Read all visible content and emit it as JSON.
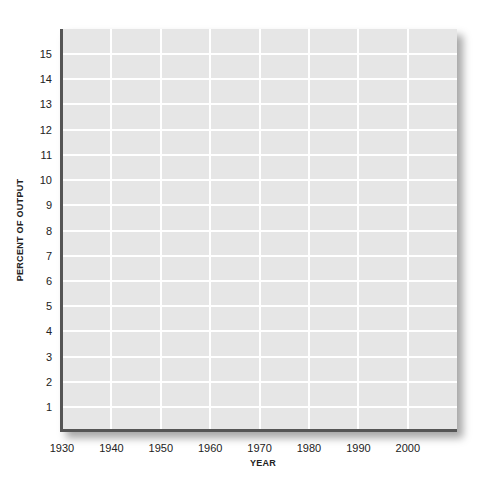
{
  "chart_data": {
    "type": "line",
    "title": "",
    "xlabel": "YEAR",
    "ylabel": "PERCENT OF OUTPUT",
    "x_ticks": [
      "1930",
      "1940",
      "1950",
      "1960",
      "1970",
      "1980",
      "1990",
      "2000"
    ],
    "y_ticks": [
      "1",
      "2",
      "3",
      "4",
      "5",
      "6",
      "7",
      "8",
      "9",
      "10",
      "11",
      "12",
      "13",
      "14",
      "15"
    ],
    "xlim": [
      1930,
      2010
    ],
    "ylim": [
      0,
      16
    ],
    "grid": true,
    "series": [],
    "colors": {
      "plot_background": "#e6e6e6",
      "grid": "#ffffff",
      "axis": "#555555"
    }
  }
}
